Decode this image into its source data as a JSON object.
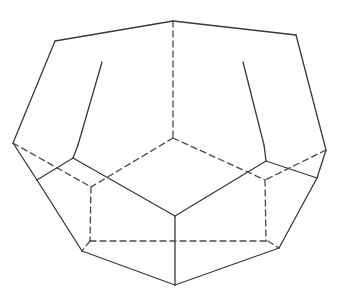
{
  "figure": {
    "width": 342,
    "height": 291,
    "background": "#ffffff",
    "stroke_color": "#3a3a3a",
    "dash_color": "#4a4a4a",
    "stroke_width": 1.3,
    "dash_pattern": "6,4",
    "solid_edges": [
      [
        55,
        41,
        173,
        21
      ],
      [
        173,
        21,
        296,
        35
      ],
      [
        55,
        41,
        13,
        143
      ],
      [
        296,
        35,
        326,
        150
      ],
      [
        102,
        62,
        78,
        145
      ],
      [
        243,
        62,
        264,
        145
      ],
      [
        78,
        145,
        73,
        158
      ],
      [
        264,
        145,
        266,
        161
      ],
      [
        13,
        143,
        37,
        180
      ],
      [
        326,
        150,
        317,
        178
      ],
      [
        73,
        158,
        37,
        180
      ],
      [
        266,
        161,
        317,
        178
      ],
      [
        73,
        158,
        175,
        216
      ],
      [
        266,
        161,
        175,
        216
      ],
      [
        175,
        216,
        175,
        285
      ],
      [
        37,
        180,
        82,
        251
      ],
      [
        317,
        178,
        279,
        248
      ],
      [
        82,
        251,
        175,
        285
      ],
      [
        279,
        248,
        175,
        285
      ]
    ],
    "dashed_edges": [
      [
        173,
        21,
        173,
        138
      ],
      [
        173,
        138,
        91,
        187
      ],
      [
        173,
        138,
        265,
        180
      ],
      [
        13,
        143,
        91,
        187
      ],
      [
        326,
        150,
        265,
        180
      ],
      [
        91,
        187,
        90,
        241
      ],
      [
        265,
        180,
        266,
        241
      ],
      [
        90,
        241,
        268,
        241
      ],
      [
        90,
        241,
        82,
        251
      ],
      [
        268,
        241,
        279,
        248
      ]
    ]
  }
}
